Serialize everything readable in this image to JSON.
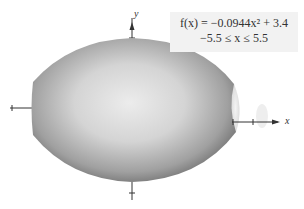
{
  "figure": {
    "function_line": "f(x) = −0.0944x² + 3.4",
    "domain_line": "−5.5 ≤ x ≤ 5.5",
    "x_axis_label": "x",
    "y_axis_label": "y",
    "colors": {
      "solid_dark": "#6e6e6e",
      "solid_light": "#e6e6e6",
      "axis": "#333333",
      "formula_bg": "#f2f2f2"
    }
  }
}
